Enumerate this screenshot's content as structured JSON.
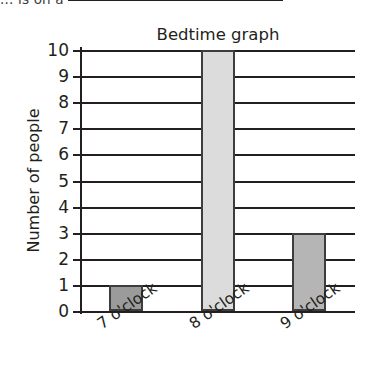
{
  "page": {
    "cropped_top_text": "... is on a"
  },
  "chart_data": {
    "type": "bar",
    "title": "Bedtime graph",
    "xlabel": "",
    "ylabel": "Number of people",
    "categories": [
      "7 o'clock",
      "8 o'clock",
      "9 o'clock"
    ],
    "values": [
      1,
      10,
      3
    ],
    "ylim": [
      0,
      10
    ],
    "ytick_labels": [
      "10",
      "9",
      "8",
      "7",
      "6",
      "5",
      "4",
      "3",
      "2",
      "1",
      "0"
    ],
    "grid": true,
    "legend": "none",
    "bar_colors": [
      "#9b9b9b",
      "#dcdcdc",
      "#b5b5b5"
    ],
    "bar_edge_color": "#3d3d3d",
    "axis_color": "#231f20",
    "text_color": "#231f20",
    "background": "#ffffff"
  }
}
